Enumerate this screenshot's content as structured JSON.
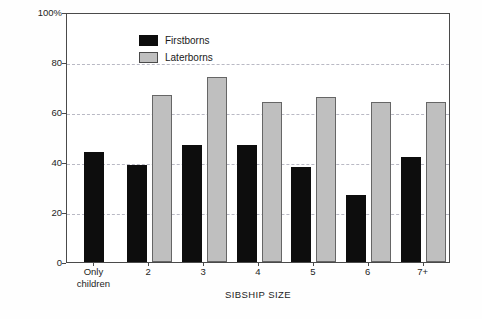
{
  "chart_data": {
    "type": "bar",
    "title": "",
    "xlabel": "SIBSHIP SIZE",
    "ylabel": "PERCENT SUPPORT",
    "categories": [
      "Only children",
      "2",
      "3",
      "4",
      "5",
      "6",
      "7+"
    ],
    "category_lines": [
      [
        "Only",
        "children"
      ],
      [
        "2"
      ],
      [
        "3"
      ],
      [
        "4"
      ],
      [
        "5"
      ],
      [
        "6"
      ],
      [
        "7+"
      ]
    ],
    "series": [
      {
        "name": "Firstborns",
        "color": "#0d0d0d",
        "values": [
          44,
          39,
          47,
          47,
          38,
          27,
          42
        ]
      },
      {
        "name": "Laterborns",
        "color": "#bfbfbf",
        "values": [
          null,
          67,
          74,
          64,
          66,
          64,
          64
        ]
      }
    ],
    "ylim": [
      0,
      100
    ],
    "yticks": [
      0,
      20,
      40,
      60,
      80,
      100
    ],
    "ytick_labels": [
      "0",
      "20",
      "40",
      "60",
      "80",
      "100%"
    ],
    "grid": "horizontal-dashed",
    "gridline_values": [
      20,
      40,
      60,
      80
    ],
    "legend_position": "top-left-inside"
  },
  "legend": {
    "entries": [
      {
        "label": "Firstborns"
      },
      {
        "label": "Laterborns"
      }
    ]
  }
}
